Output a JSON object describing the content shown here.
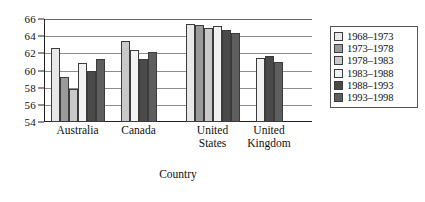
{
  "chart_data": {
    "type": "bar",
    "title": "",
    "xlabel": "Country",
    "ylabel": "",
    "ylim": [
      54,
      66
    ],
    "yticks": [
      66,
      64,
      62,
      60,
      58,
      56,
      54
    ],
    "grid": true,
    "legend_position": "right",
    "categories": [
      "Australia",
      "Canada",
      "United States",
      "United Kingdom"
    ],
    "category_labels": [
      [
        "Australia"
      ],
      [
        "Canada"
      ],
      [
        "United",
        "States"
      ],
      [
        "United",
        "Kingdom"
      ]
    ],
    "series": [
      {
        "name": "1968–1973",
        "color": "#e8e8e8",
        "values": [
          62.6,
          null,
          65.4,
          null
        ]
      },
      {
        "name": "1973–1978",
        "color": "#9a9a9a",
        "values": [
          59.3,
          null,
          65.3,
          null
        ]
      },
      {
        "name": "1978–1983",
        "color": "#c9c9c9",
        "values": [
          57.8,
          63.4,
          65.0,
          null
        ]
      },
      {
        "name": "1983–1988",
        "color": "#f2f2f2",
        "values": [
          60.9,
          62.4,
          65.2,
          61.5
        ]
      },
      {
        "name": "1988–1993",
        "color": "#4a4a4a",
        "values": [
          60.0,
          61.3,
          64.7,
          61.7
        ]
      },
      {
        "name": "1993–1998",
        "color": "#5e5e5e",
        "values": [
          61.3,
          62.2,
          64.4,
          61.0
        ]
      }
    ]
  },
  "legend": {
    "items": [
      {
        "label": "1968–1973"
      },
      {
        "label": "1973–1978"
      },
      {
        "label": "1978–1983"
      },
      {
        "label": "1983–1988"
      },
      {
        "label": "1988–1993"
      },
      {
        "label": "1993–1998"
      }
    ]
  },
  "axis": {
    "x_title": "Country"
  }
}
